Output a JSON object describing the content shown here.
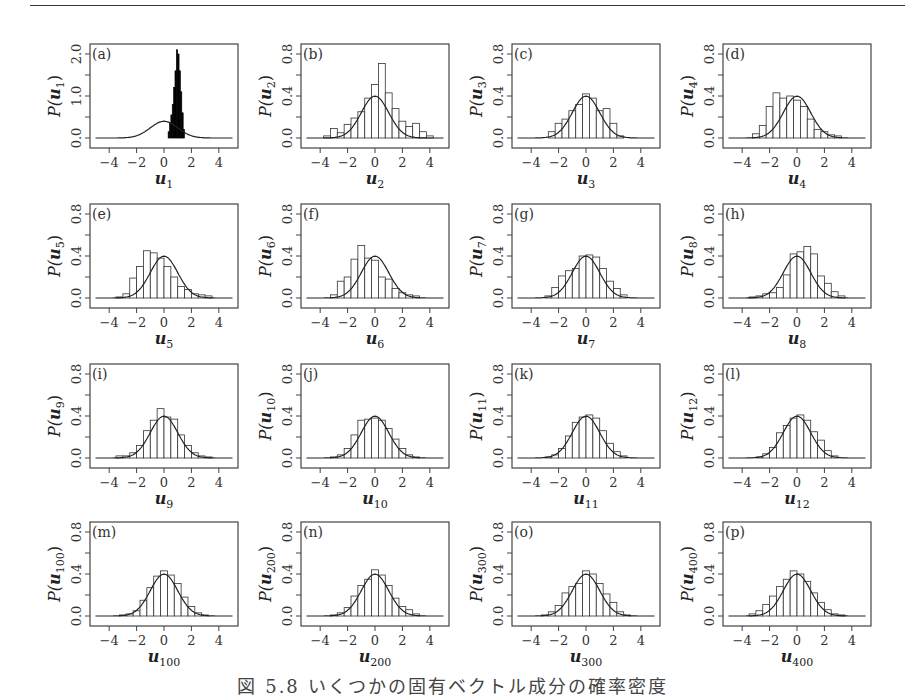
{
  "figure": {
    "caption": "図 5.8 いくつかの固有ベクトル成分の確率密度"
  },
  "chart_data": {
    "type": "bar",
    "title": "図 5.8 いくつかの固有ベクトル成分の確率密度",
    "layout": {
      "rows": 4,
      "cols": 4,
      "grid": false,
      "legend": "none"
    },
    "common_x": {
      "xlim": [
        -5,
        5
      ],
      "ticks": [
        -4,
        -2,
        0,
        2,
        4
      ]
    },
    "reference_curve": "standard normal density N(0,1), peak ≈ 0.4",
    "bin_centers": [
      -3.25,
      -2.75,
      -2.25,
      -1.75,
      -1.25,
      -0.75,
      -0.25,
      0.25,
      0.75,
      1.25,
      1.75,
      2.25,
      2.75,
      3.25
    ],
    "panels": [
      {
        "id": "a",
        "label": "(a)",
        "xlabel": "u",
        "sub": "1",
        "ylabel": "P(u",
        "ylim": [
          0,
          2.2
        ],
        "yticks": [
          "0.0",
          "1.0",
          "2.0"
        ],
        "solid": true,
        "bins": [
          {
            "x": 0.35,
            "h": 0.15
          },
          {
            "x": 0.45,
            "h": 0.35
          },
          {
            "x": 0.55,
            "h": 0.55
          },
          {
            "x": 0.65,
            "h": 0.8
          },
          {
            "x": 0.75,
            "h": 1.2
          },
          {
            "x": 0.85,
            "h": 1.6
          },
          {
            "x": 0.95,
            "h": 2.1
          },
          {
            "x": 1.05,
            "h": 2.0
          },
          {
            "x": 1.15,
            "h": 1.6
          },
          {
            "x": 1.25,
            "h": 1.1
          },
          {
            "x": 1.35,
            "h": 0.6
          },
          {
            "x": 1.45,
            "h": 0.2
          }
        ]
      },
      {
        "id": "b",
        "label": "(b)",
        "xlabel": "u",
        "sub": "2",
        "ylabel": "P(u",
        "ylim": [
          0,
          0.8
        ],
        "yticks": [
          "0.0",
          "0.4",
          "0.8"
        ],
        "values": [
          0.0,
          0.02,
          0.09,
          0.05,
          0.13,
          0.19,
          0.25,
          0.38,
          0.51,
          0.71,
          0.43,
          0.28,
          0.16,
          0.11,
          0.14,
          0.06,
          0.02
        ]
      },
      {
        "id": "c",
        "label": "(c)",
        "xlabel": "u",
        "sub": "3",
        "ylabel": "P(u",
        "ylim": [
          0,
          0.8
        ],
        "yticks": [
          "0.0",
          "0.4",
          "0.8"
        ],
        "values": [
          0.06,
          0.14,
          0.18,
          0.26,
          0.32,
          0.42,
          0.38,
          0.26,
          0.28,
          0.14,
          0.02
        ]
      },
      {
        "id": "d",
        "label": "(d)",
        "xlabel": "u",
        "sub": "4",
        "ylabel": "P(u",
        "ylim": [
          0,
          0.8
        ],
        "yticks": [
          "0.0",
          "0.4",
          "0.8"
        ],
        "values": [
          0.04,
          0.12,
          0.3,
          0.43,
          0.38,
          0.4,
          0.36,
          0.3,
          0.18,
          0.08,
          0.06,
          0.03,
          0.02
        ]
      },
      {
        "id": "e",
        "label": "(e)",
        "xlabel": "u",
        "sub": "5",
        "ylabel": "P(u",
        "ylim": [
          0,
          0.8
        ],
        "yticks": [
          "0.0",
          "0.4",
          "0.8"
        ],
        "values": [
          0.01,
          0.04,
          0.19,
          0.3,
          0.45,
          0.43,
          0.38,
          0.3,
          0.2,
          0.11,
          0.08,
          0.04,
          0.03,
          0.02
        ]
      },
      {
        "id": "f",
        "label": "(f)",
        "xlabel": "u",
        "sub": "6",
        "ylabel": "P(u",
        "ylim": [
          0,
          0.8
        ],
        "yticks": [
          "0.0",
          "0.4",
          "0.8"
        ],
        "values": [
          0.03,
          0.16,
          0.2,
          0.37,
          0.5,
          0.38,
          0.36,
          0.2,
          0.18,
          0.09,
          0.05,
          0.03,
          0.02
        ]
      },
      {
        "id": "g",
        "label": "(g)",
        "xlabel": "u",
        "sub": "7",
        "ylabel": "P(u",
        "ylim": [
          0,
          0.8
        ],
        "yticks": [
          "0.0",
          "0.4",
          "0.8"
        ],
        "values": [
          0.02,
          0.1,
          0.21,
          0.26,
          0.28,
          0.4,
          0.41,
          0.39,
          0.28,
          0.16,
          0.09,
          0.03
        ]
      },
      {
        "id": "h",
        "label": "(h)",
        "xlabel": "u",
        "sub": "8",
        "ylabel": "P(u",
        "ylim": [
          0,
          0.8
        ],
        "yticks": [
          "0.0",
          "0.4",
          "0.8"
        ],
        "values": [
          0.01,
          0.02,
          0.04,
          0.05,
          0.1,
          0.22,
          0.42,
          0.44,
          0.49,
          0.42,
          0.21,
          0.14,
          0.06,
          0.02
        ]
      },
      {
        "id": "i",
        "label": "(i)",
        "xlabel": "u",
        "sub": "9",
        "ylabel": "P(u",
        "ylim": [
          0,
          0.8
        ],
        "yticks": [
          "0.0",
          "0.4",
          "0.8"
        ],
        "values": [
          0.02,
          0.02,
          0.05,
          0.12,
          0.26,
          0.36,
          0.47,
          0.39,
          0.37,
          0.22,
          0.12,
          0.05,
          0.02,
          0.01
        ]
      },
      {
        "id": "j",
        "label": "(j)",
        "xlabel": "u",
        "sub": "10",
        "ylabel": "P(u",
        "ylim": [
          0,
          0.8
        ],
        "yticks": [
          "0.0",
          "0.4",
          "0.8"
        ],
        "values": [
          0.01,
          0.03,
          0.09,
          0.22,
          0.36,
          0.37,
          0.38,
          0.36,
          0.28,
          0.18,
          0.09,
          0.03,
          0.01
        ]
      },
      {
        "id": "k",
        "label": "(k)",
        "xlabel": "u",
        "sub": "11",
        "ylabel": "P(u",
        "ylim": [
          0,
          0.8
        ],
        "yticks": [
          "0.0",
          "0.4",
          "0.8"
        ],
        "values": [
          0.01,
          0.03,
          0.09,
          0.21,
          0.34,
          0.39,
          0.41,
          0.38,
          0.26,
          0.14,
          0.06,
          0.02
        ]
      },
      {
        "id": "l",
        "label": "(l)",
        "xlabel": "u",
        "sub": "12",
        "ylabel": "P(u",
        "ylim": [
          0,
          0.8
        ],
        "yticks": [
          "0.0",
          "0.4",
          "0.8"
        ],
        "values": [
          0.01,
          0.04,
          0.1,
          0.24,
          0.31,
          0.38,
          0.41,
          0.36,
          0.25,
          0.17,
          0.07,
          0.02
        ]
      },
      {
        "id": "m",
        "label": "(m)",
        "xlabel": "u",
        "sub": "100",
        "ylabel": "P(u",
        "ylim": [
          0,
          0.8
        ],
        "yticks": [
          "0.0",
          "0.4",
          "0.8"
        ],
        "values": [
          0.01,
          0.02,
          0.05,
          0.15,
          0.27,
          0.38,
          0.43,
          0.39,
          0.31,
          0.18,
          0.09,
          0.03,
          0.01
        ]
      },
      {
        "id": "n",
        "label": "(n)",
        "xlabel": "u",
        "sub": "200",
        "ylabel": "P(u",
        "ylim": [
          0,
          0.8
        ],
        "yticks": [
          "0.0",
          "0.4",
          "0.8"
        ],
        "values": [
          0.01,
          0.03,
          0.08,
          0.19,
          0.29,
          0.35,
          0.44,
          0.39,
          0.29,
          0.17,
          0.09,
          0.06,
          0.02
        ]
      },
      {
        "id": "o",
        "label": "(o)",
        "xlabel": "u",
        "sub": "300",
        "ylabel": "P(u",
        "ylim": [
          0,
          0.8
        ],
        "yticks": [
          "0.0",
          "0.4",
          "0.8"
        ],
        "values": [
          0.01,
          0.04,
          0.1,
          0.22,
          0.28,
          0.31,
          0.43,
          0.4,
          0.31,
          0.21,
          0.13,
          0.04,
          0.01
        ]
      },
      {
        "id": "p",
        "label": "(p)",
        "xlabel": "u",
        "sub": "400",
        "ylabel": "P(u",
        "ylim": [
          0,
          0.8
        ],
        "yticks": [
          "0.0",
          "0.4",
          "0.8"
        ],
        "values": [
          0.02,
          0.05,
          0.11,
          0.19,
          0.28,
          0.35,
          0.43,
          0.4,
          0.33,
          0.22,
          0.13,
          0.06,
          0.02,
          0.01
        ]
      }
    ]
  }
}
